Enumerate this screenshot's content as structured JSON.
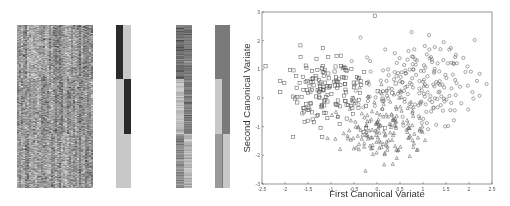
{
  "figure": {
    "left_panel": {
      "description": "Heatmap of expression matrix with three class-sorted blocks, plus class indicator bars and reduced projections",
      "blocks": [
        {
          "name": "heatmap-main",
          "x": 17,
          "y": 25,
          "w": 76,
          "h": 163
        },
        {
          "name": "class-indicator",
          "x": 116,
          "y": 25,
          "w": 15,
          "h": 163
        },
        {
          "name": "projection-bars",
          "x": 176,
          "y": 25,
          "w": 16,
          "h": 163
        },
        {
          "name": "centroid-bars",
          "x": 215,
          "y": 25,
          "w": 15,
          "h": 163
        }
      ],
      "colors": {
        "dark": "#2a2a2a",
        "mid": "#7a7a7a",
        "light": "#c8c8c8"
      }
    }
  },
  "chart_data": {
    "type": "scatter",
    "title": "",
    "xlabel": "First Canonical Variate",
    "ylabel": "Second Canonical Variate",
    "xlim": [
      -2.5,
      2.5
    ],
    "ylim": [
      -3,
      3
    ],
    "xticks": [
      "-2.5",
      "-2",
      "-1.5",
      "-1",
      "-0.5",
      "0",
      "0.5",
      "1",
      "1.5",
      "2",
      "2.5"
    ],
    "yticks": [
      "-3",
      "-2",
      "-1",
      "0",
      "1",
      "2",
      "3"
    ],
    "grid": false,
    "legend": null,
    "series": [
      {
        "name": "class-1",
        "marker": "square",
        "center": [
          -1.1,
          0.3
        ],
        "spread": [
          0.55,
          0.6
        ],
        "n": 170
      },
      {
        "name": "class-2",
        "marker": "circle",
        "center": [
          0.9,
          0.5
        ],
        "spread": [
          0.6,
          0.7
        ],
        "n": 190
      },
      {
        "name": "class-3",
        "marker": "triangle",
        "center": [
          0.15,
          -1.0
        ],
        "spread": [
          0.45,
          0.6
        ],
        "n": 170
      }
    ],
    "marker_color": "#555555"
  }
}
